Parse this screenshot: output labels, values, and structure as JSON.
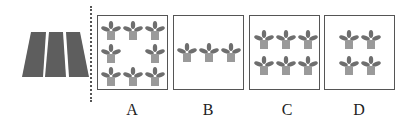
{
  "figure": {
    "reference": {
      "name": "field-strips",
      "strips": 3,
      "color": "#5a5a5a"
    },
    "options": [
      {
        "label": "A",
        "plants": 8,
        "layout": "ring-3x3-center-empty"
      },
      {
        "label": "B",
        "plants": 3,
        "layout": "row-1x3"
      },
      {
        "label": "C",
        "plants": 6,
        "layout": "grid-2x3"
      },
      {
        "label": "D",
        "plants": 4,
        "layout": "grid-2x2"
      }
    ],
    "colors": {
      "pot": "#9a9a9a",
      "leaf": "#6e6e6e",
      "border": "#555555"
    }
  }
}
